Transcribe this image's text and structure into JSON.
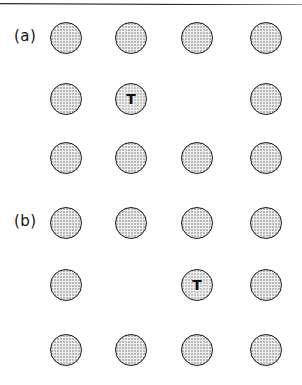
{
  "figure": {
    "top_rule": "horizontal-rule",
    "background_color": "#ffffff",
    "atom_fill_color": "#efefef",
    "atom_stipple_color": "#b9b9b9",
    "atom_outline_color": "#1a1a1a",
    "atom_diameter_px": 32,
    "columns_x": [
      50,
      115,
      181,
      250
    ],
    "panels": [
      {
        "id": "panel-a",
        "label": "(a)",
        "label_x": 14,
        "label_y": 29,
        "rows_y": [
          22,
          83,
          142
        ],
        "grid": [
          [
            {
              "type": "atom",
              "label": ""
            },
            {
              "type": "atom",
              "label": ""
            },
            {
              "type": "atom",
              "label": ""
            },
            {
              "type": "atom",
              "label": ""
            }
          ],
          [
            {
              "type": "atom",
              "label": ""
            },
            {
              "type": "atom",
              "label": "T"
            },
            {
              "type": "vacancy",
              "label": ""
            },
            {
              "type": "atom",
              "label": ""
            }
          ],
          [
            {
              "type": "atom",
              "label": ""
            },
            {
              "type": "atom",
              "label": ""
            },
            {
              "type": "atom",
              "label": ""
            },
            {
              "type": "atom",
              "label": ""
            }
          ]
        ]
      },
      {
        "id": "panel-b",
        "label": "(b)",
        "label_x": 14,
        "label_y": 214,
        "rows_y": [
          207,
          269,
          334
        ],
        "grid": [
          [
            {
              "type": "atom",
              "label": ""
            },
            {
              "type": "atom",
              "label": ""
            },
            {
              "type": "atom",
              "label": ""
            },
            {
              "type": "atom",
              "label": ""
            }
          ],
          [
            {
              "type": "atom",
              "label": ""
            },
            {
              "type": "vacancy",
              "label": ""
            },
            {
              "type": "atom",
              "label": "T"
            },
            {
              "type": "atom",
              "label": ""
            }
          ],
          [
            {
              "type": "atom",
              "label": ""
            },
            {
              "type": "atom",
              "label": ""
            },
            {
              "type": "atom",
              "label": ""
            },
            {
              "type": "atom",
              "label": ""
            }
          ]
        ]
      }
    ]
  }
}
